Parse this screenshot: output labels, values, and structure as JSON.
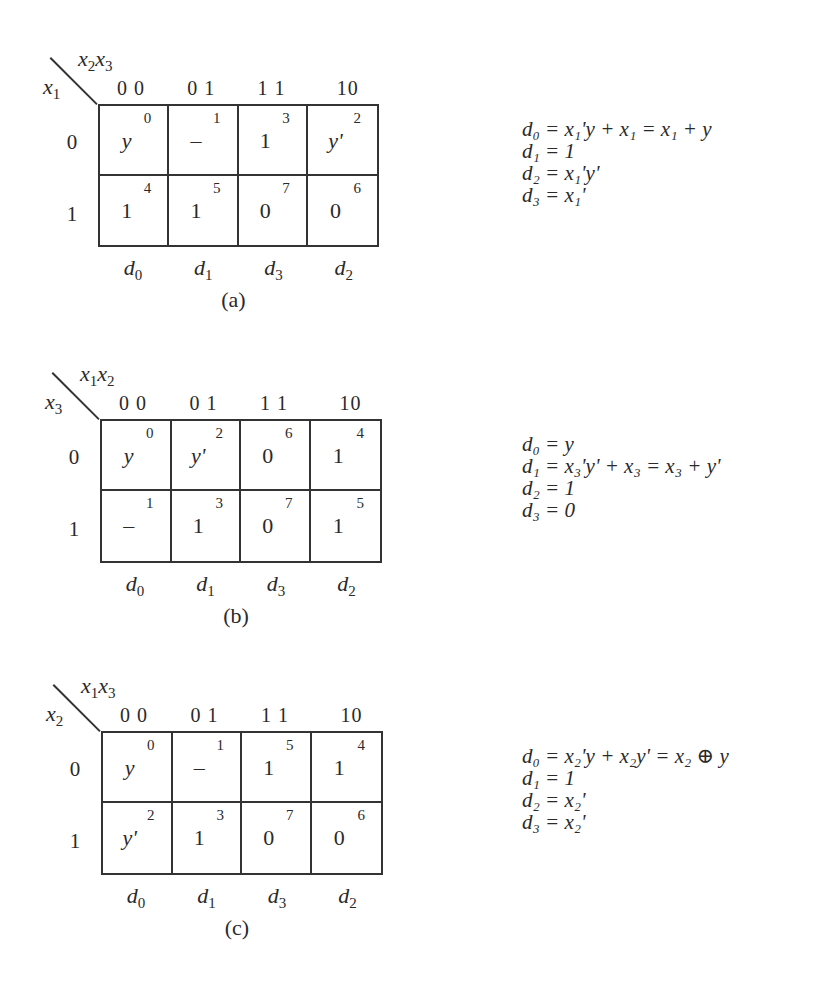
{
  "figure": {
    "panels": [
      {
        "id": "a",
        "caption": "(a)",
        "col_var_1": "x",
        "col_var_1_sub": "2",
        "col_var_2": "x",
        "col_var_2_sub": "3",
        "row_var": "x",
        "row_var_sub": "1",
        "col_headers": [
          "0 0",
          "0 1",
          "1 1",
          "10"
        ],
        "row_headers": [
          "0",
          "1"
        ],
        "cells": [
          {
            "minterm": "0",
            "value": "y",
            "italic": true
          },
          {
            "minterm": "1",
            "value": "–",
            "italic": false
          },
          {
            "minterm": "3",
            "value": "1",
            "italic": false
          },
          {
            "minterm": "2",
            "value": "y'",
            "italic": true
          },
          {
            "minterm": "4",
            "value": "1",
            "italic": false
          },
          {
            "minterm": "5",
            "value": "1",
            "italic": false
          },
          {
            "minterm": "7",
            "value": "0",
            "italic": false
          },
          {
            "minterm": "6",
            "value": "0",
            "italic": false
          }
        ],
        "d_labels": [
          {
            "d": "d",
            "s": "0"
          },
          {
            "d": "d",
            "s": "1"
          },
          {
            "d": "d",
            "s": "3"
          },
          {
            "d": "d",
            "s": "2"
          }
        ],
        "equations": [
          "d₀ = x₁'y + x₁ = x₁ + y",
          "d₁ = 1",
          "d₂ = x₁'y'",
          "d₃ = x₁'"
        ]
      },
      {
        "id": "b",
        "caption": "(b)",
        "col_var_1": "x",
        "col_var_1_sub": "1",
        "col_var_2": "x",
        "col_var_2_sub": "2",
        "row_var": "x",
        "row_var_sub": "3",
        "col_headers": [
          "0 0",
          "0 1",
          "1 1",
          "10"
        ],
        "row_headers": [
          "0",
          "1"
        ],
        "cells": [
          {
            "minterm": "0",
            "value": "y",
            "italic": true
          },
          {
            "minterm": "2",
            "value": "y'",
            "italic": true
          },
          {
            "minterm": "6",
            "value": "0",
            "italic": false
          },
          {
            "minterm": "4",
            "value": "1",
            "italic": false
          },
          {
            "minterm": "1",
            "value": "–",
            "italic": false
          },
          {
            "minterm": "3",
            "value": "1",
            "italic": false
          },
          {
            "minterm": "7",
            "value": "0",
            "italic": false
          },
          {
            "minterm": "5",
            "value": "1",
            "italic": false
          }
        ],
        "d_labels": [
          {
            "d": "d",
            "s": "0"
          },
          {
            "d": "d",
            "s": "1"
          },
          {
            "d": "d",
            "s": "3"
          },
          {
            "d": "d",
            "s": "2"
          }
        ],
        "equations": [
          "d₀ = y",
          "d₁ = x₃'y' + x₃ = x₃ + y'",
          "d₂ = 1",
          "d₃ = 0"
        ]
      },
      {
        "id": "c",
        "caption": "(c)",
        "col_var_1": "x",
        "col_var_1_sub": "1",
        "col_var_2": "x",
        "col_var_2_sub": "3",
        "row_var": "x",
        "row_var_sub": "2",
        "col_headers": [
          "0 0",
          "0 1",
          "1 1",
          "10"
        ],
        "row_headers": [
          "0",
          "1"
        ],
        "cells": [
          {
            "minterm": "0",
            "value": "y",
            "italic": true
          },
          {
            "minterm": "1",
            "value": "–",
            "italic": false
          },
          {
            "minterm": "5",
            "value": "1",
            "italic": false
          },
          {
            "minterm": "4",
            "value": "1",
            "italic": false
          },
          {
            "minterm": "2",
            "value": "y'",
            "italic": true
          },
          {
            "minterm": "3",
            "value": "1",
            "italic": false
          },
          {
            "minterm": "7",
            "value": "0",
            "italic": false
          },
          {
            "minterm": "6",
            "value": "0",
            "italic": false
          }
        ],
        "d_labels": [
          {
            "d": "d",
            "s": "0"
          },
          {
            "d": "d",
            "s": "1"
          },
          {
            "d": "d",
            "s": "3"
          },
          {
            "d": "d",
            "s": "2"
          }
        ],
        "equations": [
          "d₀ = x₂'y + x₂y' = x₂ ⊕ y",
          "d₁ = 1",
          "d₂ = x₂'",
          "d₃ = x₂'"
        ]
      }
    ]
  }
}
